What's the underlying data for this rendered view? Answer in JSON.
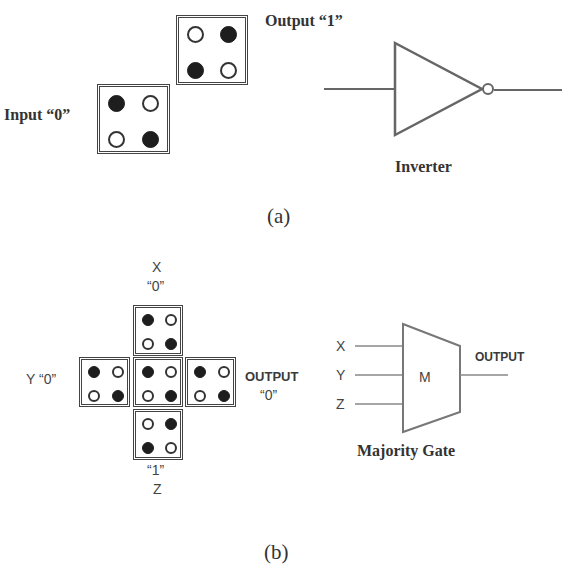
{
  "panel_a": {
    "input_label": "Input “0”",
    "output_label": "Output “1”",
    "gate_label": "Inverter",
    "caption": "(a)",
    "input_cell": {
      "dots": [
        "filled",
        "empty",
        "empty",
        "filled"
      ]
    },
    "output_cell": {
      "dots": [
        "empty",
        "filled",
        "filled",
        "empty"
      ]
    }
  },
  "panel_b": {
    "x_label": "X",
    "x_value": "“0”",
    "y_label": "Y “0”",
    "z_value": "“1”",
    "z_label": "Z",
    "output_label": "OUTPUT",
    "output_value": "“0”",
    "cells": {
      "top": [
        "filled",
        "empty",
        "empty",
        "filled"
      ],
      "left": [
        "filled",
        "empty",
        "empty",
        "filled"
      ],
      "center": [
        "filled",
        "empty",
        "empty",
        "filled"
      ],
      "right": [
        "filled",
        "empty",
        "empty",
        "filled"
      ],
      "bottom": [
        "empty",
        "filled",
        "filled",
        "empty"
      ]
    },
    "gate": {
      "inputs": [
        "X",
        "Y",
        "Z"
      ],
      "symbol": "M",
      "output_label": "OUTPUT",
      "label": "Majority Gate"
    },
    "caption": "(b)"
  },
  "colors": {
    "line": "#555555",
    "dot_filled": "#1e1e1e",
    "text": "#333333"
  }
}
